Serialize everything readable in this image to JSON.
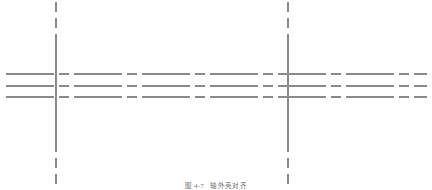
{
  "figure": {
    "caption_label": "图 4-7",
    "caption_text": "轴外壳对齐",
    "width": 432,
    "height": 190,
    "background_color": "#ffffff"
  },
  "style": {
    "line_color": "#8a8a8a",
    "line_color_light": "#a5a5a5",
    "horizontal_stroke_width": 2.0,
    "vertical_stroke_width": 1.4,
    "dash_long": 48,
    "dash_short": 10,
    "dash_gap": 5
  },
  "chart_data": {
    "type": "line",
    "xlabel": "",
    "ylabel": "",
    "xlim": [
      0,
      432
    ],
    "ylim": [
      0,
      190
    ],
    "grid": false,
    "legend": null,
    "series": [
      {
        "name": "horizontal-centerline-top",
        "orientation": "horizontal",
        "linestyle": "dashdot",
        "color": "#8a8a8a",
        "y": 74,
        "x_start": 6,
        "x_end": 427
      },
      {
        "name": "horizontal-centerline-middle",
        "orientation": "horizontal",
        "linestyle": "dashdot",
        "color": "#8a8a8a",
        "y": 86,
        "x_start": 6,
        "x_end": 427
      },
      {
        "name": "horizontal-centerline-bottom",
        "orientation": "horizontal",
        "linestyle": "dashdot",
        "color": "#8a8a8a",
        "y": 97,
        "x_start": 6,
        "x_end": 427
      },
      {
        "name": "vertical-centerline-left",
        "orientation": "vertical",
        "linestyle": "dashdot",
        "color": "#8a8a8a",
        "x": 56,
        "y_start": 2,
        "y_end": 184
      },
      {
        "name": "vertical-centerline-right",
        "orientation": "vertical",
        "linestyle": "dashdot",
        "color": "#8a8a8a",
        "x": 288,
        "y_start": 2,
        "y_end": 184
      }
    ],
    "intersections": [
      {
        "name": "crossing-left",
        "x": 56,
        "y": 86
      },
      {
        "name": "crossing-right",
        "x": 288,
        "y": 86
      }
    ]
  }
}
